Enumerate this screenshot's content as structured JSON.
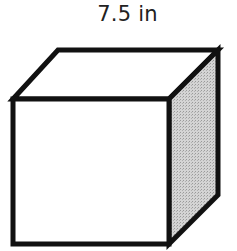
{
  "diagram": {
    "type": "cube",
    "edge_label": "7.5 in",
    "colors": {
      "stroke": "#111111",
      "front_face": "#ffffff",
      "top_face": "#ffffff",
      "side_face": "#c8c8c8"
    }
  }
}
